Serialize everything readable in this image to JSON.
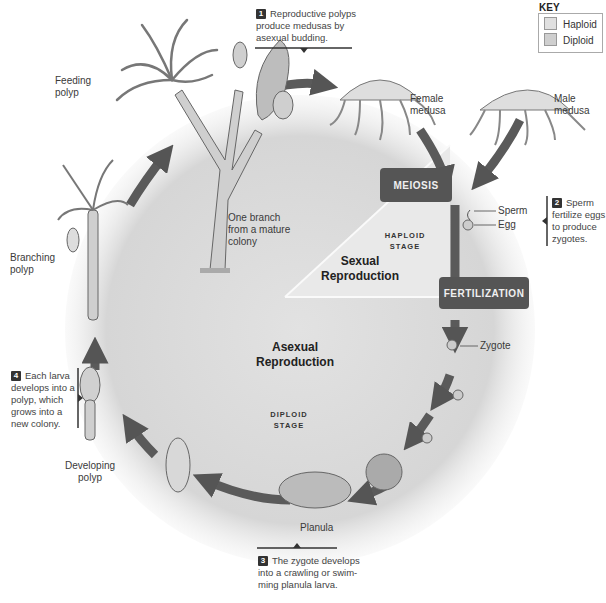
{
  "colors": {
    "diploid_fill": "#dcdcdc",
    "haploid_fill": "#e8e8e8",
    "arrow": "#5a5a5a",
    "process_box": "#555555",
    "process_text": "#f0f0f0",
    "background": "#ffffff"
  },
  "key": {
    "title": "KEY",
    "items": [
      {
        "label": "Haploid",
        "swatch": "#e0e0e0"
      },
      {
        "label": "Diploid",
        "swatch": "#cfcfcf"
      }
    ]
  },
  "steps": [
    {
      "number": "1",
      "text": "Reproductive polyps produce medusas by asexual budding."
    },
    {
      "number": "2",
      "text": "Sperm fertilize eggs to produce zygotes."
    },
    {
      "number": "3",
      "text": "The zygote develops into a crawling or swim-ming planula larva."
    },
    {
      "number": "4",
      "text": "Each larva develops into a polyp, which grows into a new colony."
    }
  ],
  "processes": {
    "meiosis": "MEIOSIS",
    "fertilization": "FERTILIZATION"
  },
  "regions": {
    "sexual": "Sexual Reproduction",
    "asexual": "Asexual Reproduction",
    "haploid_stage": [
      "HAPLOID",
      "STAGE"
    ],
    "diploid_stage": [
      "DIPLOID",
      "STAGE"
    ]
  },
  "labels": {
    "feeding_polyp": "Feeding polyp",
    "branch": "One branch from a mature colony",
    "female_medusa": "Female medusa",
    "male_medusa": "Male medusa",
    "sperm": "Sperm",
    "egg": "Egg",
    "zygote": "Zygote",
    "planula": "Planula",
    "developing_polyp": "Developing polyp",
    "branching_polyp": "Branching polyp"
  }
}
